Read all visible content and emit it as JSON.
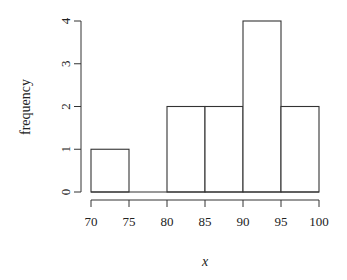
{
  "chart_data": {
    "type": "bar",
    "subtype": "histogram",
    "title": "",
    "xlabel": "x",
    "ylabel": "frequency",
    "bins": [
      [
        70,
        75
      ],
      [
        75,
        80
      ],
      [
        80,
        85
      ],
      [
        85,
        90
      ],
      [
        90,
        95
      ],
      [
        95,
        100
      ]
    ],
    "categories": [
      "70-75",
      "75-80",
      "80-85",
      "85-90",
      "90-95",
      "95-100"
    ],
    "values": [
      1,
      0,
      2,
      2,
      4,
      2
    ],
    "x_ticks": [
      "70",
      "75",
      "80",
      "85",
      "90",
      "95",
      "100"
    ],
    "y_ticks": [
      "0",
      "1",
      "2",
      "3",
      "4"
    ],
    "xlim": [
      70,
      100
    ],
    "ylim": [
      0,
      4
    ],
    "grid": false,
    "legend": null,
    "bar_fill": "#ffffff",
    "bar_stroke": "#333333"
  }
}
